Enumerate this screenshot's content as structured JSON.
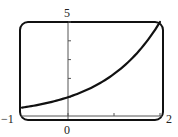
{
  "chart_data": {
    "type": "line",
    "title": "",
    "xlabel": "",
    "ylabel": "",
    "xlim": [
      -1,
      2
    ],
    "ylim": [
      0,
      5
    ],
    "grid": false,
    "legend": null,
    "function": "y = 5^(x/2)",
    "x_tick_labels": [
      "-1",
      "0",
      "2"
    ],
    "y_tick_labels": [
      "5"
    ],
    "x_ticks": [
      0,
      1,
      2
    ],
    "y_ticks": [
      1,
      2,
      3,
      4,
      5
    ],
    "series": [
      {
        "name": "curve",
        "x": [
          -1,
          -0.5,
          0,
          0.5,
          1,
          1.5,
          2
        ],
        "y": [
          0.45,
          0.67,
          1.0,
          1.5,
          2.24,
          3.34,
          5.0
        ]
      }
    ],
    "frame": "rounded viewing window",
    "colors": {
      "curve": "#111111",
      "axes": "#555555",
      "frame": "#111111"
    }
  },
  "labels": {
    "xmin": "−1",
    "xmax": "2",
    "ymax": "5",
    "origin_x": "0"
  }
}
